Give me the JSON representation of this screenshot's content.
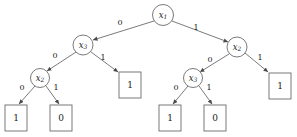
{
  "figure": {
    "type": "binary-decision-diagram",
    "background_color": "#ffffff",
    "stroke_color": "#6b6b6b",
    "text_color": "#1a1a1a",
    "width": 297,
    "height": 137
  },
  "nodes": [
    {
      "id": "n1",
      "label": "x",
      "subscript": "1",
      "full": "x1",
      "cx": 163,
      "cy": 15,
      "r": 10.5
    },
    {
      "id": "n2",
      "label": "x",
      "subscript": "3",
      "full": "x3",
      "cx": 83,
      "cy": 45,
      "r": 10.0
    },
    {
      "id": "n3",
      "label": "x",
      "subscript": "2",
      "full": "x2",
      "cx": 237,
      "cy": 47,
      "r": 10.0
    },
    {
      "id": "n4",
      "label": "x",
      "subscript": "2",
      "full": "x2",
      "cx": 40,
      "cy": 78,
      "r": 9.5
    },
    {
      "id": "n5",
      "label": "x",
      "subscript": "3",
      "full": "x3",
      "cx": 193,
      "cy": 78,
      "r": 9.5
    }
  ],
  "leaves": [
    {
      "id": "L1",
      "value": "1",
      "x": 5,
      "y": 105,
      "w": 22,
      "h": 26
    },
    {
      "id": "L2",
      "value": "0",
      "x": 50,
      "y": 105,
      "w": 22,
      "h": 26
    },
    {
      "id": "L3",
      "value": "1",
      "x": 119,
      "y": 72,
      "w": 22,
      "h": 26
    },
    {
      "id": "L4",
      "value": "1",
      "x": 159,
      "y": 105,
      "w": 22,
      "h": 26
    },
    {
      "id": "L5",
      "value": "0",
      "x": 204,
      "y": 105,
      "w": 22,
      "h": 26
    },
    {
      "id": "L6",
      "value": "1",
      "x": 269,
      "y": 73,
      "w": 22,
      "h": 26
    }
  ],
  "edges": [
    {
      "id": "e1",
      "from": "n1",
      "to": "n2",
      "label": "0",
      "x1": 154,
      "y1": 21,
      "x2": 93,
      "y2": 40,
      "lx": 120,
      "ly": 23
    },
    {
      "id": "e2",
      "from": "n1",
      "to": "n3",
      "label": "1",
      "x1": 172,
      "y1": 21,
      "x2": 228,
      "y2": 42,
      "lx": 196,
      "ly": 28
    },
    {
      "id": "e3",
      "from": "n2",
      "to": "n4",
      "label": "0",
      "x1": 76,
      "y1": 52,
      "x2": 47,
      "y2": 71,
      "lx": 55,
      "ly": 56
    },
    {
      "id": "e4",
      "from": "n2",
      "to": "L3",
      "label": "1",
      "x1": 91,
      "y1": 52,
      "x2": 118,
      "y2": 72,
      "lx": 103,
      "ly": 58
    },
    {
      "id": "e5",
      "from": "n3",
      "to": "n5",
      "label": "0",
      "x1": 229,
      "y1": 54,
      "x2": 200,
      "y2": 72,
      "lx": 210,
      "ly": 60
    },
    {
      "id": "e6",
      "from": "n3",
      "to": "L6",
      "label": "1",
      "x1": 245,
      "y1": 53,
      "x2": 268,
      "y2": 72,
      "lx": 260,
      "ly": 58
    },
    {
      "id": "e7",
      "from": "n4",
      "to": "L1",
      "label": "0",
      "x1": 35,
      "y1": 86,
      "x2": 19,
      "y2": 104,
      "lx": 22,
      "ly": 88
    },
    {
      "id": "e8",
      "from": "n4",
      "to": "L2",
      "label": "1",
      "x1": 46,
      "y1": 86,
      "x2": 59,
      "y2": 104,
      "lx": 56,
      "ly": 88
    },
    {
      "id": "e9",
      "from": "n5",
      "to": "L4",
      "label": "0",
      "x1": 188,
      "y1": 86,
      "x2": 173,
      "y2": 104,
      "lx": 176,
      "ly": 88
    },
    {
      "id": "e10",
      "from": "n5",
      "to": "L5",
      "label": "1",
      "x1": 199,
      "y1": 86,
      "x2": 212,
      "y2": 104,
      "lx": 209,
      "ly": 88
    }
  ]
}
